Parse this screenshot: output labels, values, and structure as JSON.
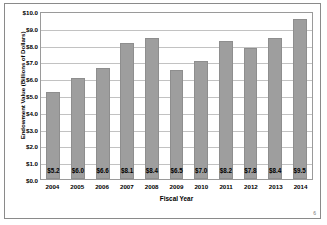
{
  "chart_data": {
    "type": "bar",
    "title": "",
    "xlabel": "Fiscal Year",
    "ylabel": "Endowment Value (Billions of Dollars)",
    "categories": [
      "2004",
      "2005",
      "2006",
      "2007",
      "2008",
      "2009",
      "2010",
      "2011",
      "2012",
      "2013",
      "2014"
    ],
    "values": [
      5.2,
      6.0,
      6.6,
      8.1,
      8.4,
      6.5,
      7.0,
      8.2,
      7.8,
      8.4,
      9.5
    ],
    "data_labels": [
      "$5.2",
      "$6.0",
      "$6.6",
      "$8.1",
      "$8.4",
      "$6.5",
      "$7.0",
      "$8.2",
      "$7.8",
      "$8.4",
      "$9.5"
    ],
    "ylim": [
      0,
      10
    ],
    "ytick_values": [
      10.0,
      9.0,
      8.0,
      7.0,
      6.0,
      5.0,
      4.0,
      3.0,
      2.0,
      1.0,
      0.0
    ],
    "ytick_labels": [
      "$10.0",
      "$9.0",
      "$8.0",
      "$7.0",
      "$6.0",
      "$5.0",
      "$4.0",
      "$3.0",
      "$2.0",
      "$1.0",
      "$0.0"
    ],
    "grid": true,
    "legend": false,
    "bar_color": "#9e9e9e",
    "gridline_color": "#c2c2c2",
    "border_color": "#8a8a8a"
  },
  "footer": {
    "page_marker": "6"
  }
}
